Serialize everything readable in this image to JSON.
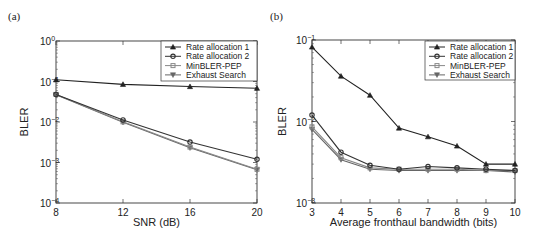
{
  "chart_data": [
    {
      "panel": "(a)",
      "type": "line",
      "xlabel": "SNR (dB)",
      "ylabel": "BLER",
      "yscale": "log",
      "ylim": [
        0.0001,
        1
      ],
      "xlim": [
        8,
        20
      ],
      "x": [
        8,
        12,
        16,
        20
      ],
      "xticks": [
        "8",
        "12",
        "16",
        "20"
      ],
      "yticks": [
        "10^0",
        "10^-1",
        "10^-2",
        "10^-3",
        "10^-4"
      ],
      "legend_position": "upper right",
      "series": [
        {
          "name": "Rate allocation 1",
          "marker": "triangle-up",
          "color": "#222222",
          "values": [
            0.11,
            0.085,
            0.075,
            0.068
          ]
        },
        {
          "name": "Rate allocation 2",
          "marker": "circle",
          "color": "#333333",
          "values": [
            0.048,
            0.0112,
            0.0032,
            0.0012
          ]
        },
        {
          "name": "MinBLER-PEP",
          "marker": "square",
          "color": "#888888",
          "values": [
            0.048,
            0.0101,
            0.0024,
            0.00068
          ]
        },
        {
          "name": "Exhaust Search",
          "marker": "triangle-down",
          "color": "#666666",
          "values": [
            0.047,
            0.0098,
            0.0023,
            0.00066
          ]
        }
      ]
    },
    {
      "panel": "(b)",
      "type": "line",
      "xlabel": "Average fronthaul bandwidth (bits)",
      "ylabel": "BLER",
      "yscale": "log",
      "ylim": [
        0.001,
        0.1
      ],
      "xlim": [
        3,
        10
      ],
      "x": [
        3,
        4,
        5,
        6,
        7,
        8,
        9,
        10
      ],
      "xticks": [
        "3",
        "4",
        "5",
        "6",
        "7",
        "8",
        "9",
        "10"
      ],
      "yticks": [
        "10^-1",
        "10^-2",
        "10^-3"
      ],
      "legend_position": "upper right",
      "series": [
        {
          "name": "Rate allocation 1",
          "marker": "triangle-up",
          "color": "#222222",
          "values": [
            0.082,
            0.036,
            0.021,
            0.0083,
            0.0065,
            0.005,
            0.003,
            0.003
          ]
        },
        {
          "name": "Rate allocation 2",
          "marker": "circle",
          "color": "#333333",
          "values": [
            0.012,
            0.0042,
            0.0029,
            0.0026,
            0.0028,
            0.0027,
            0.0026,
            0.0025
          ]
        },
        {
          "name": "MinBLER-PEP",
          "marker": "square",
          "color": "#888888",
          "values": [
            0.0086,
            0.0036,
            0.0027,
            0.0026,
            0.0026,
            0.0026,
            0.0025,
            0.0025
          ]
        },
        {
          "name": "Exhaust Search",
          "marker": "triangle-down",
          "color": "#666666",
          "values": [
            0.008,
            0.0034,
            0.0026,
            0.0025,
            0.0025,
            0.0025,
            0.0025,
            0.0024
          ]
        }
      ]
    }
  ]
}
